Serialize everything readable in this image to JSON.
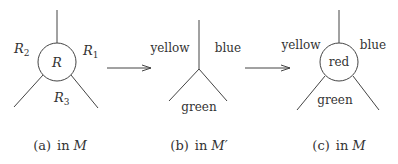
{
  "panels": [
    {
      "id": "a",
      "caption_prefix": "(a)",
      "caption_in": "in",
      "caption_space": "M",
      "center_label": "R",
      "labels": {
        "left": {
          "base": "R",
          "sub": "2"
        },
        "right": {
          "base": "R",
          "sub": "1"
        },
        "bottom": {
          "base": "R",
          "sub": "3"
        }
      }
    },
    {
      "id": "b",
      "caption_prefix": "(b)",
      "caption_in": "in",
      "caption_space": "M′",
      "labels": {
        "left": "yellow",
        "right": "blue",
        "bottom": "green"
      }
    },
    {
      "id": "c",
      "caption_prefix": "(c)",
      "caption_in": "in",
      "caption_space": "M",
      "center_label": "red",
      "labels": {
        "left": "yellow",
        "right": "blue",
        "bottom": "green"
      }
    }
  ],
  "arrows": [
    "a-to-b",
    "b-to-c"
  ]
}
